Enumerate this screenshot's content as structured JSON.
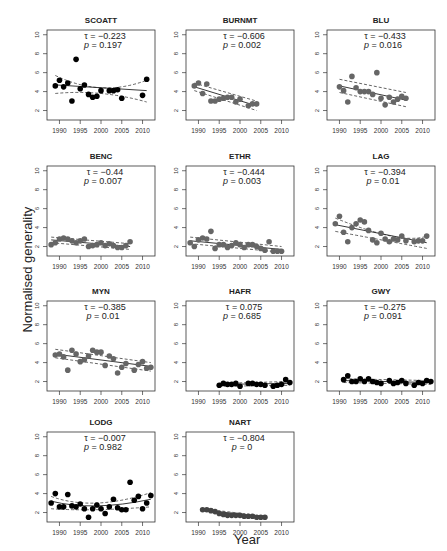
{
  "figure": {
    "ylabel": "Normalised generality",
    "xlabel": "Year"
  },
  "chart_data": {
    "type": "scatter",
    "layout": "4x3 small multiples",
    "xlabel": "Year",
    "ylabel": "Normalised generality",
    "xlim": [
      1987,
      2013
    ],
    "ylim": [
      1,
      10.5
    ],
    "xticks": [
      1990,
      1995,
      2000,
      2005,
      2010
    ],
    "yticks": [
      2,
      4,
      6,
      8,
      10
    ],
    "panels": [
      {
        "title": "SCOATT",
        "tau": "-0.223",
        "p": "0.197",
        "color": "#000000",
        "x": [
          1989,
          1990,
          1991,
          1992,
          1993,
          1994,
          1995,
          1996,
          1997,
          1998,
          1999,
          2000,
          2002,
          2003,
          2004,
          2005,
          2010,
          2011
        ],
        "y": [
          4.6,
          5.2,
          4.5,
          4.9,
          3.0,
          7.4,
          4.3,
          4.7,
          3.7,
          3.4,
          3.5,
          4.1,
          4.1,
          4.1,
          4.2,
          3.3,
          3.6,
          5.3
        ],
        "trend": [
          [
            1989,
            4.7
          ],
          [
            2011,
            4.1
          ]
        ],
        "ci_upper": [
          [
            1989,
            5.7
          ],
          [
            2000,
            4.4
          ],
          [
            2011,
            5.2
          ]
        ],
        "ci_lower": [
          [
            1989,
            3.8
          ],
          [
            2000,
            3.8
          ],
          [
            2011,
            2.9
          ]
        ]
      },
      {
        "title": "BURNMT",
        "tau": "-0.606",
        "p": "0.002",
        "color": "#666666",
        "x": [
          1989,
          1990,
          1991,
          1992,
          1993,
          1994,
          1995,
          1996,
          1997,
          1998,
          1999,
          2000,
          2002,
          2003,
          2004
        ],
        "y": [
          4.6,
          4.9,
          3.8,
          4.8,
          3.0,
          3.0,
          3.2,
          3.3,
          3.4,
          3.4,
          2.9,
          3.2,
          2.5,
          2.7,
          2.7
        ],
        "trend": [
          [
            1989,
            4.5
          ],
          [
            2004,
            2.5
          ]
        ],
        "ci_upper": [
          [
            1989,
            4.9
          ],
          [
            2004,
            3.0
          ]
        ],
        "ci_lower": [
          [
            1989,
            4.1
          ],
          [
            2004,
            2.0
          ]
        ]
      },
      {
        "title": "BLU",
        "tau": "-0.433",
        "p": "0.016",
        "color": "#666666",
        "x": [
          1990,
          1991,
          1992,
          1993,
          1994,
          1995,
          1996,
          1997,
          1998,
          1999,
          2000,
          2001,
          2002,
          2003,
          2004,
          2005,
          2006
        ],
        "y": [
          4.5,
          4.1,
          2.9,
          5.6,
          4.4,
          4.0,
          4.0,
          4.0,
          3.7,
          6.0,
          3.3,
          2.6,
          3.4,
          2.9,
          3.2,
          3.5,
          3.3
        ],
        "trend": [
          [
            1990,
            4.6
          ],
          [
            2006,
            3.1
          ]
        ],
        "ci_upper": [
          [
            1990,
            5.3
          ],
          [
            2006,
            3.9
          ]
        ],
        "ci_lower": [
          [
            1990,
            3.9
          ],
          [
            2006,
            2.4
          ]
        ]
      },
      {
        "title": "BENC",
        "tau": "-0.44",
        "p": "0.007",
        "color": "#666666",
        "x": [
          1988,
          1989,
          1990,
          1991,
          1992,
          1993,
          1994,
          1995,
          1996,
          1997,
          1998,
          1999,
          2000,
          2001,
          2002,
          2003,
          2004,
          2005,
          2006,
          2007
        ],
        "y": [
          2.2,
          2.4,
          2.8,
          2.9,
          2.8,
          2.6,
          2.4,
          2.6,
          2.8,
          2.0,
          2.1,
          2.2,
          2.4,
          2.1,
          2.3,
          2.1,
          1.9,
          1.9,
          2.1,
          2.5
        ],
        "trend": [
          [
            1988,
            2.7
          ],
          [
            2007,
            2.0
          ]
        ],
        "ci_upper": [
          [
            1988,
            3.0
          ],
          [
            2007,
            2.3
          ]
        ],
        "ci_lower": [
          [
            1988,
            2.4
          ],
          [
            2007,
            1.7
          ]
        ]
      },
      {
        "title": "ETHR",
        "tau": "-0.444",
        "p": "0.003",
        "color": "#666666",
        "x": [
          1988,
          1989,
          1990,
          1991,
          1992,
          1993,
          1994,
          1995,
          1996,
          1997,
          1998,
          1999,
          2000,
          2001,
          2002,
          2003,
          2004,
          2005,
          2006,
          2007,
          2008,
          2009,
          2010
        ],
        "y": [
          2.4,
          2.0,
          2.7,
          2.9,
          2.8,
          3.6,
          1.8,
          2.2,
          2.2,
          1.9,
          2.1,
          2.4,
          2.2,
          1.9,
          2.2,
          2.2,
          2.0,
          1.8,
          1.6,
          2.5,
          1.5,
          1.5,
          1.5
        ],
        "trend": [
          [
            1988,
            2.6
          ],
          [
            2010,
            1.7
          ]
        ],
        "ci_upper": [
          [
            1988,
            3.0
          ],
          [
            2010,
            2.0
          ]
        ],
        "ci_lower": [
          [
            1988,
            2.3
          ],
          [
            2010,
            1.4
          ]
        ]
      },
      {
        "title": "LAG",
        "tau": "-0.394",
        "p": "0.01",
        "color": "#666666",
        "x": [
          1989,
          1990,
          1991,
          1992,
          1993,
          1994,
          1995,
          1996,
          1997,
          1998,
          1999,
          2000,
          2001,
          2002,
          2003,
          2004,
          2005,
          2006,
          2008,
          2009,
          2010,
          2011
        ],
        "y": [
          4.4,
          5.2,
          3.5,
          2.5,
          4.0,
          4.4,
          4.8,
          4.6,
          3.7,
          2.7,
          2.4,
          3.4,
          2.8,
          2.5,
          2.8,
          2.7,
          3.1,
          2.6,
          2.5,
          2.6,
          2.6,
          3.1
        ],
        "trend": [
          [
            1989,
            4.3
          ],
          [
            2011,
            2.4
          ]
        ],
        "ci_upper": [
          [
            1989,
            5.0
          ],
          [
            2005,
            3.1
          ],
          [
            2011,
            3.1
          ]
        ],
        "ci_lower": [
          [
            1989,
            3.6
          ],
          [
            2005,
            2.5
          ],
          [
            2011,
            1.8
          ]
        ]
      },
      {
        "title": "MYN",
        "tau": "-0.385",
        "p": "0.01",
        "color": "#666666",
        "x": [
          1989,
          1990,
          1991,
          1992,
          1993,
          1994,
          1995,
          1996,
          1997,
          1998,
          1999,
          2000,
          2001,
          2002,
          2003,
          2004,
          2005,
          2006,
          2008,
          2009,
          2010,
          2011,
          2012
        ],
        "y": [
          4.8,
          4.9,
          4.6,
          3.2,
          5.3,
          4.9,
          4.1,
          4.3,
          4.7,
          5.3,
          5.1,
          5.1,
          3.7,
          4.7,
          4.4,
          2.9,
          3.5,
          3.9,
          3.2,
          3.8,
          4.1,
          3.4,
          3.5
        ],
        "trend": [
          [
            1989,
            4.9
          ],
          [
            2012,
            3.6
          ]
        ],
        "ci_upper": [
          [
            1989,
            5.4
          ],
          [
            2012,
            4.0
          ]
        ],
        "ci_lower": [
          [
            1989,
            4.5
          ],
          [
            2012,
            3.1
          ]
        ]
      },
      {
        "title": "HAFR",
        "tau": "0.075",
        "p": "0.685",
        "color": "#000000",
        "x": [
          1995,
          1996,
          1997,
          1998,
          1999,
          2000,
          2002,
          2003,
          2004,
          2005,
          2006,
          2008,
          2009,
          2010,
          2011,
          2012
        ],
        "y": [
          1.6,
          1.8,
          1.7,
          1.7,
          1.8,
          1.5,
          1.8,
          1.8,
          1.7,
          1.7,
          1.6,
          1.5,
          1.6,
          1.7,
          2.2,
          1.9
        ],
        "trend": [
          [
            1995,
            1.7
          ],
          [
            2012,
            1.8
          ]
        ],
        "ci_upper": [
          [
            1995,
            1.8
          ],
          [
            2012,
            2.0
          ]
        ],
        "ci_lower": [
          [
            1995,
            1.5
          ],
          [
            2012,
            1.6
          ]
        ]
      },
      {
        "title": "GWY",
        "tau": "-0.275",
        "p": "0.091",
        "color": "#000000",
        "x": [
          1991,
          1992,
          1993,
          1994,
          1995,
          1996,
          1997,
          1998,
          1999,
          2000,
          2002,
          2003,
          2004,
          2005,
          2006,
          2008,
          2009,
          2010,
          2011,
          2012
        ],
        "y": [
          2.2,
          2.6,
          2.0,
          2.0,
          2.3,
          2.0,
          2.3,
          2.0,
          1.9,
          1.8,
          2.1,
          1.8,
          1.9,
          2.1,
          1.8,
          1.6,
          1.9,
          1.8,
          2.1,
          2.0
        ],
        "trend": [
          [
            1991,
            2.1
          ],
          [
            2012,
            1.9
          ]
        ],
        "ci_upper": [
          [
            1991,
            2.3
          ],
          [
            2012,
            2.1
          ]
        ],
        "ci_lower": [
          [
            1991,
            1.9
          ],
          [
            2012,
            1.7
          ]
        ]
      },
      {
        "title": "LODG",
        "tau": "-0.007",
        "p": "0.982",
        "color": "#000000",
        "x": [
          1988,
          1989,
          1990,
          1991,
          1992,
          1993,
          1994,
          1995,
          1996,
          1997,
          1998,
          1999,
          2000,
          2001,
          2002,
          2003,
          2004,
          2005,
          2006,
          2007,
          2008,
          2009,
          2010,
          2011,
          2012
        ],
        "y": [
          3.0,
          4.0,
          2.6,
          2.6,
          3.9,
          2.7,
          2.6,
          2.9,
          2.4,
          1.5,
          2.4,
          2.8,
          2.4,
          1.9,
          2.6,
          3.4,
          2.5,
          2.3,
          2.3,
          5.2,
          3.3,
          3.7,
          2.4,
          3.0,
          3.8
        ],
        "trend": [
          [
            1988,
            3.2
          ],
          [
            1998,
            2.7
          ],
          [
            2012,
            3.4
          ]
        ],
        "ci_upper": [
          [
            1988,
            3.7
          ],
          [
            1998,
            3.0
          ],
          [
            2012,
            4.1
          ]
        ],
        "ci_lower": [
          [
            1988,
            2.4
          ],
          [
            1998,
            2.3
          ],
          [
            2012,
            2.6
          ]
        ]
      },
      {
        "title": "NART",
        "tau": "-0.804",
        "p": "0",
        "color": "#444444",
        "x": [
          1991,
          1992,
          1993,
          1994,
          1995,
          1996,
          1997,
          1998,
          1999,
          2000,
          2001,
          2002,
          2003,
          2004,
          2005,
          2006
        ],
        "y": [
          2.3,
          2.3,
          2.2,
          2.1,
          1.9,
          1.8,
          1.7,
          1.7,
          1.7,
          1.7,
          1.6,
          1.6,
          1.6,
          1.5,
          1.5,
          1.5
        ],
        "trend": [
          [
            1991,
            2.3
          ],
          [
            2006,
            1.5
          ]
        ],
        "ci_upper": [
          [
            1991,
            2.4
          ],
          [
            2006,
            1.6
          ]
        ],
        "ci_lower": [
          [
            1991,
            2.2
          ],
          [
            2006,
            1.4
          ]
        ]
      }
    ]
  }
}
